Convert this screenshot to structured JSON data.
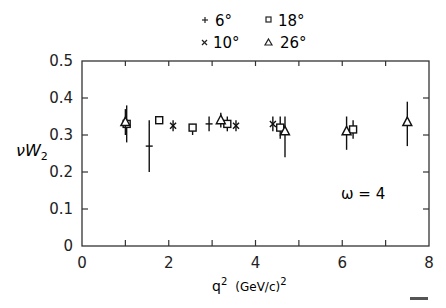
{
  "chart_data": {
    "type": "scatter",
    "title": "",
    "xlabel": "q² (GeV/c)²",
    "ylabel": "νW₂",
    "xlim": [
      0,
      8
    ],
    "ylim": [
      0,
      0.5
    ],
    "xticks": [
      0,
      2,
      4,
      6,
      8
    ],
    "xticks_minor": [
      1,
      3,
      5,
      7
    ],
    "yticks": [
      0,
      0.1,
      0.2,
      0.3,
      0.4,
      0.5
    ],
    "ytick_labels": [
      "0",
      "0.1",
      "0.2",
      "0.3",
      "0.4",
      "0.5"
    ],
    "grid": false,
    "legend_position": "top-center",
    "annotation": "ω = 4",
    "legend": [
      {
        "marker": "plus",
        "label": "6°"
      },
      {
        "marker": "cross",
        "label": "10°"
      },
      {
        "marker": "square",
        "label": "18°"
      },
      {
        "marker": "triangle",
        "label": "26°"
      }
    ],
    "series": [
      {
        "name": "6°",
        "marker": "plus",
        "points": [
          {
            "x": 1.55,
            "y": 0.27,
            "ylo": 0.2,
            "yhi": 0.34
          },
          {
            "x": 2.93,
            "y": 0.33,
            "ylo": 0.31,
            "yhi": 0.35
          }
        ]
      },
      {
        "name": "10°",
        "marker": "cross",
        "points": [
          {
            "x": 2.1,
            "y": 0.325,
            "ylo": 0.31,
            "yhi": 0.34
          },
          {
            "x": 3.55,
            "y": 0.325,
            "ylo": 0.31,
            "yhi": 0.34
          },
          {
            "x": 4.4,
            "y": 0.33,
            "ylo": 0.31,
            "yhi": 0.35
          }
        ]
      },
      {
        "name": "18°",
        "marker": "square",
        "points": [
          {
            "x": 1.03,
            "y": 0.33,
            "ylo": 0.28,
            "yhi": 0.38
          },
          {
            "x": 1.78,
            "y": 0.34,
            "ylo": 0.33,
            "yhi": 0.35
          },
          {
            "x": 2.55,
            "y": 0.32,
            "ylo": 0.3,
            "yhi": 0.33
          },
          {
            "x": 3.35,
            "y": 0.33,
            "ylo": 0.31,
            "yhi": 0.35
          },
          {
            "x": 4.57,
            "y": 0.32,
            "ylo": 0.29,
            "yhi": 0.35
          },
          {
            "x": 6.25,
            "y": 0.315,
            "ylo": 0.29,
            "yhi": 0.34
          }
        ]
      },
      {
        "name": "26°",
        "marker": "triangle",
        "points": [
          {
            "x": 1.0,
            "y": 0.335,
            "ylo": 0.3,
            "yhi": 0.37
          },
          {
            "x": 3.2,
            "y": 0.34,
            "ylo": 0.32,
            "yhi": 0.36
          },
          {
            "x": 4.68,
            "y": 0.31,
            "ylo": 0.24,
            "yhi": 0.35
          },
          {
            "x": 6.1,
            "y": 0.31,
            "ylo": 0.26,
            "yhi": 0.35
          },
          {
            "x": 7.5,
            "y": 0.335,
            "ylo": 0.27,
            "yhi": 0.39
          }
        ]
      }
    ]
  },
  "labels": {
    "ylabel_main": "νW",
    "ylabel_sub": "2",
    "xlabel_main": "q",
    "xlabel_sup": "2",
    "xlabel_units": "(GeV/c)",
    "xlabel_units_sup": "2",
    "annotation": "ω = 4",
    "legend_6": "6°",
    "legend_10": "10°",
    "legend_18": "18°",
    "legend_26": "26°"
  }
}
